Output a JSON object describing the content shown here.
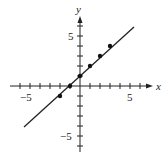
{
  "chart_data": {
    "type": "line",
    "title": "",
    "xlabel": "x",
    "ylabel": "y",
    "xlim": [
      -7,
      7
    ],
    "ylim": [
      -7,
      7
    ],
    "x_tick_labels": [
      "-5",
      "5"
    ],
    "y_tick_labels": [
      "5",
      "-5"
    ],
    "x_ticks": [
      -6,
      -5,
      -4,
      -3,
      -2,
      -1,
      1,
      2,
      3,
      4,
      5,
      6
    ],
    "y_ticks": [
      -6,
      -5,
      -4,
      -3,
      -2,
      -1,
      1,
      2,
      3,
      4,
      5,
      6
    ],
    "grid": false,
    "series": [
      {
        "name": "y = x + 1",
        "line": {
          "x": [
            -5.6,
            5.4
          ],
          "y": [
            -4.1,
            5.9
          ]
        },
        "points": [
          {
            "x": -2,
            "y": -1
          },
          {
            "x": -1,
            "y": 0
          },
          {
            "x": 0,
            "y": 1
          },
          {
            "x": 1,
            "y": 2
          },
          {
            "x": 2,
            "y": 3
          },
          {
            "x": 3,
            "y": 4
          }
        ]
      }
    ],
    "colors": {
      "axis": "#222222",
      "line": "#222222",
      "points": "#111111"
    }
  },
  "labels": {
    "x_axis": "x",
    "y_axis": "y",
    "x_neg5": "−5",
    "x_pos5": "5",
    "y_pos5": "5",
    "y_neg5": "−5"
  }
}
